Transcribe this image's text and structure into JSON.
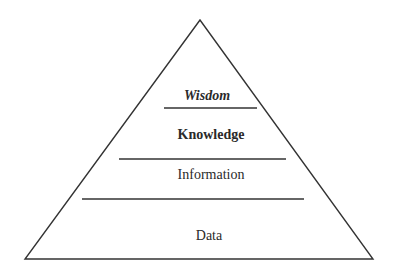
{
  "diagram": {
    "type": "pyramid",
    "title": "",
    "levels": [
      {
        "label": "Wisdom",
        "style": "bold-italic",
        "order_from_top": 1
      },
      {
        "label": "Knowledge",
        "style": "bold",
        "order_from_top": 2
      },
      {
        "label": "Information",
        "style": "regular",
        "order_from_top": 3
      },
      {
        "label": "Data",
        "style": "regular",
        "order_from_top": 4
      }
    ],
    "colors": {
      "line": "#333333",
      "text": "#2a2a2a",
      "background": "#ffffff"
    }
  }
}
